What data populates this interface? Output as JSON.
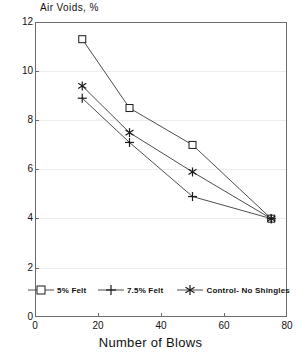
{
  "chart_data": {
    "type": "line",
    "title": "",
    "ylabel": "Air Voids, %",
    "xlabel": "Number of Blows",
    "xlim": [
      0,
      80
    ],
    "ylim": [
      0,
      12
    ],
    "xticks": [
      0,
      20,
      40,
      60,
      80
    ],
    "yticks": [
      0,
      2,
      4,
      6,
      8,
      10,
      12
    ],
    "grid": true,
    "legend_position": "inside-bottom-left",
    "x": [
      15,
      30,
      50,
      75
    ],
    "series": [
      {
        "name": "5% Felt",
        "marker": "square",
        "values": [
          11.3,
          8.5,
          7.0,
          4.0
        ]
      },
      {
        "name": "7.5% Felt",
        "marker": "plus",
        "values": [
          8.9,
          7.1,
          4.9,
          4.0
        ]
      },
      {
        "name": "Control- No Shingles",
        "marker": "asterisk",
        "values": [
          9.4,
          7.5,
          5.9,
          4.0
        ]
      }
    ]
  },
  "axes": {
    "y_title": "Air Voids, %",
    "x_title": "Number of Blows",
    "y_tick_labels": [
      "12",
      "10",
      "8",
      "6",
      "4",
      "2",
      "0"
    ],
    "x_tick_labels": [
      "0",
      "20",
      "40",
      "60",
      "80"
    ]
  },
  "legend": {
    "items": [
      {
        "label": "5% Felt",
        "marker": "square-marker"
      },
      {
        "label": "7.5% Felt",
        "marker": "plus-marker"
      },
      {
        "label": "Control- No Shingles",
        "marker": "asterisk-marker"
      }
    ]
  },
  "colors": {
    "line": "#4d4d4d",
    "marker": "#1a1a1a",
    "axis": "#6b6b6b",
    "grid": "#ededed",
    "text": "#111111",
    "background": "#ffffff"
  }
}
